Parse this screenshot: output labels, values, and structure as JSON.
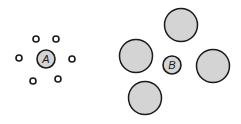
{
  "colors": {
    "fill": "#d4d4d4",
    "stroke": "#1a1a1a",
    "background": "#ffffff"
  },
  "groups": [
    {
      "label": "A",
      "center": {
        "cx": 46,
        "cy": 59,
        "r": 9
      },
      "surrounding": [
        {
          "cx": 36,
          "cy": 39,
          "r": 3
        },
        {
          "cx": 56,
          "cy": 39,
          "r": 3
        },
        {
          "cx": 19,
          "cy": 58,
          "r": 3
        },
        {
          "cx": 72,
          "cy": 59,
          "r": 3
        },
        {
          "cx": 33,
          "cy": 81,
          "r": 3
        },
        {
          "cx": 58,
          "cy": 79,
          "r": 3
        }
      ]
    },
    {
      "label": "B",
      "center": {
        "cx": 172,
        "cy": 65,
        "r": 9
      },
      "surrounding": [
        {
          "cx": 181,
          "cy": 25,
          "r": 16.5
        },
        {
          "cx": 136,
          "cy": 56,
          "r": 16.5
        },
        {
          "cx": 213,
          "cy": 66,
          "r": 16.5
        },
        {
          "cx": 145,
          "cy": 98,
          "r": 16.5
        }
      ]
    }
  ]
}
